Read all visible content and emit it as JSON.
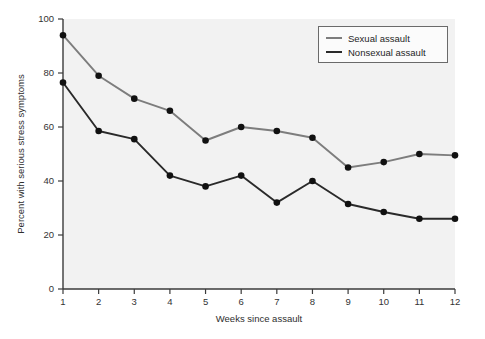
{
  "chart_data": {
    "type": "line",
    "title": "",
    "xlabel": "Weeks since assault",
    "ylabel": "Percent with serious stress symptoms",
    "x": [
      1,
      2,
      3,
      4,
      5,
      6,
      7,
      8,
      9,
      10,
      11,
      12
    ],
    "xticklabels": [
      "1",
      "2",
      "3",
      "4",
      "5",
      "6",
      "7",
      "8",
      "9",
      "10",
      "11",
      "12"
    ],
    "yticks": [
      0,
      20,
      40,
      60,
      80,
      100
    ],
    "yticklabels": [
      "0",
      "20",
      "40",
      "60",
      "80",
      "100"
    ],
    "xlim": [
      1,
      12
    ],
    "ylim": [
      0,
      100
    ],
    "grid": false,
    "legend_position": "top-right",
    "series": [
      {
        "name": "Sexual assault",
        "color": "#7d7d7d",
        "marker": "circle",
        "marker_color": "#111111",
        "values": [
          94,
          79,
          70.5,
          66,
          55,
          60,
          58.5,
          56,
          45,
          47,
          50,
          49.5
        ]
      },
      {
        "name": "Nonsexual assault",
        "color": "#2a2a2a",
        "marker": "circle",
        "marker_color": "#111111",
        "values": [
          76.5,
          58.5,
          55.5,
          42,
          38,
          42,
          32,
          40,
          31.5,
          28.5,
          26,
          26
        ]
      }
    ]
  },
  "axes": {
    "y_label": "Percent with serious stress symptoms",
    "x_label": "Weeks since assault"
  },
  "legend": {
    "items": [
      {
        "label": "Sexual assault"
      },
      {
        "label": "Nonsexual assault"
      }
    ]
  },
  "colors": {
    "plot_background": "#f2f2f2",
    "page_background": "#ffffff",
    "axis": "#3b3b3b",
    "series_sexual": "#7d7d7d",
    "series_nonsexual": "#2a2a2a",
    "marker": "#111111"
  }
}
